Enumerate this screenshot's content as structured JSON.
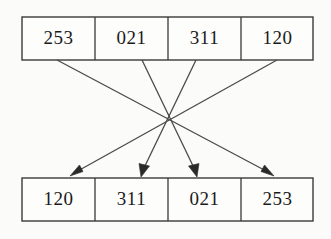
{
  "diagram": {
    "type": "permutation-crossbar",
    "background_color": "#fbfbfa",
    "line_color": "#3a3a3a",
    "text_color": "#1a1a1a",
    "crossing_point": {
      "x": 168,
      "y": 118
    },
    "top_row": {
      "label": "top-row",
      "cells": [
        {
          "value": "253",
          "index": 0
        },
        {
          "value": "021",
          "index": 1
        },
        {
          "value": "311",
          "index": 2
        },
        {
          "value": "120",
          "index": 3
        }
      ]
    },
    "bottom_row": {
      "label": "bottom-row",
      "cells": [
        {
          "value": "120",
          "index": 0
        },
        {
          "value": "311",
          "index": 1
        },
        {
          "value": "021",
          "index": 2
        },
        {
          "value": "253",
          "index": 3
        }
      ]
    },
    "arrows": [
      {
        "from_index": 0,
        "to_index": 3,
        "from_value": "253",
        "to_value": "253"
      },
      {
        "from_index": 1,
        "to_index": 2,
        "from_value": "021",
        "to_value": "021"
      },
      {
        "from_index": 2,
        "to_index": 1,
        "from_value": "311",
        "to_value": "311"
      },
      {
        "from_index": 3,
        "to_index": 0,
        "from_value": "120",
        "to_value": "120"
      }
    ]
  }
}
